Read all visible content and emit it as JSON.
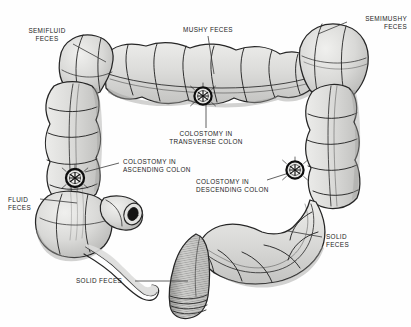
{
  "figure": {
    "type": "anatomical-illustration",
    "width": 411,
    "height": 327,
    "style": "black-and-white pen-and-ink medical line drawing with gray wash",
    "colors": {
      "background": "#fefefe",
      "ink": "#1b1b1b",
      "bowel_fill": "#d8d8d6",
      "bowel_shadow": "#b4b4b2",
      "bowel_highlight": "#ebebe9",
      "leader_line": "#3a3a3a",
      "stoma_ring": "#111111",
      "label_text": "#1b1b1b"
    }
  },
  "labels": [
    {
      "id": "semifluid-feces",
      "line1": "SEMIFLUID",
      "line2": "FECES",
      "align": "center",
      "x": 14,
      "y": 27,
      "leader": {
        "x1": 73,
        "y1": 44,
        "x2": 106,
        "y2": 62
      }
    },
    {
      "id": "mushy-feces",
      "line1": "MUSHY FECES",
      "line2": "",
      "align": "center",
      "x": 172,
      "y": 26,
      "leader": {
        "x1": 208,
        "y1": 36,
        "x2": 214,
        "y2": 74
      }
    },
    {
      "id": "semimushy-feces",
      "line1": "SEMIMUSHY",
      "line2": "FECES",
      "align": "right",
      "x": 349,
      "y": 15,
      "leader": {
        "x1": 347,
        "y1": 22,
        "x2": 318,
        "y2": 34
      }
    },
    {
      "id": "colostomy-transverse-colon",
      "line1": "COLOSTOMY IN",
      "line2": "TRANSVERSE COLON",
      "align": "center",
      "x": 173,
      "y": 130,
      "leader": {
        "x1": 206,
        "y1": 128,
        "x2": 206,
        "y2": 104
      }
    },
    {
      "id": "colostomy-ascending-colon",
      "line1": "COLOSTOMY IN",
      "line2": "ASCENDING COLON",
      "align": "left",
      "x": 121,
      "y": 158,
      "leader": {
        "x1": 119,
        "y1": 163,
        "x2": 85,
        "y2": 172
      }
    },
    {
      "id": "colostomy-descending-colon",
      "line1": "COLOSTOMY IN",
      "line2": "DESCENDING COLON",
      "align": "left",
      "x": 196,
      "y": 178,
      "leader": {
        "x1": 267,
        "y1": 180,
        "x2": 292,
        "y2": 172
      }
    },
    {
      "id": "fluid-feces",
      "line1": "FLUID",
      "line2": "FECES",
      "align": "left",
      "x": 8,
      "y": 196,
      "leader": {
        "x1": 40,
        "y1": 199,
        "x2": 77,
        "y2": 203
      }
    },
    {
      "id": "solid-feces-right",
      "line1": "SOLID",
      "line2": "FECES",
      "align": "left",
      "x": 324,
      "y": 233,
      "leader": {
        "x1": 322,
        "y1": 237,
        "x2": 288,
        "y2": 231
      }
    },
    {
      "id": "solid-feces-bottom",
      "line1": "SOLID FECES",
      "line2": "",
      "align": "left",
      "x": 76,
      "y": 278,
      "leader": {
        "x1": 135,
        "y1": 281,
        "x2": 188,
        "y2": 281
      }
    }
  ],
  "stomas": [
    {
      "id": "stoma-transverse",
      "cx": 203,
      "cy": 96,
      "r": 8.6
    },
    {
      "id": "stoma-ascending",
      "cx": 75,
      "cy": 178,
      "r": 9.0
    },
    {
      "id": "stoma-descending",
      "cx": 295,
      "cy": 170,
      "r": 8.6
    }
  ],
  "anatomy": [
    {
      "id": "cecum",
      "name": "Cecum"
    },
    {
      "id": "appendix",
      "name": "Vermiform appendix"
    },
    {
      "id": "ileum-stump",
      "name": "Ileum stump"
    },
    {
      "id": "ascending-colon",
      "name": "Ascending colon"
    },
    {
      "id": "hepatic-flexure",
      "name": "Hepatic flexure"
    },
    {
      "id": "transverse-colon",
      "name": "Transverse colon"
    },
    {
      "id": "splenic-flexure",
      "name": "Splenic flexure"
    },
    {
      "id": "descending-colon",
      "name": "Descending colon"
    },
    {
      "id": "sigmoid-colon",
      "name": "Sigmoid colon"
    },
    {
      "id": "rectum",
      "name": "Rectum"
    },
    {
      "id": "anal-canal",
      "name": "Anal canal"
    }
  ]
}
